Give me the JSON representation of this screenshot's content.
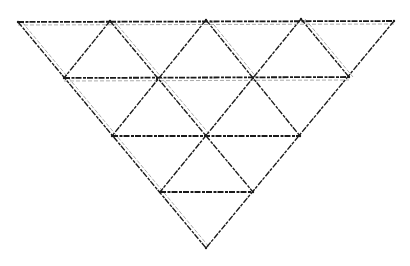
{
  "diagram": {
    "title": "",
    "colors": {
      "background": "#ffffff",
      "stroke": "#1a1a1a",
      "shadow": "#555555"
    },
    "stroke_width": 1.4,
    "dash": "6 1.5 3 1",
    "vertices": {
      "A0": [
        18,
        22
      ],
      "A1": [
        110,
        21
      ],
      "A2": [
        206,
        20
      ],
      "A3": [
        301,
        19
      ],
      "A4": [
        394,
        21
      ],
      "B0": [
        64,
        78
      ],
      "B1": [
        157,
        79
      ],
      "B2": [
        253,
        78
      ],
      "B3": [
        349,
        77
      ],
      "C0": [
        112,
        136
      ],
      "C1": [
        206,
        135
      ],
      "C2": [
        300,
        136
      ],
      "D0": [
        160,
        192
      ],
      "D1": [
        253,
        192
      ],
      "E0": [
        206,
        248
      ]
    },
    "horizontal_edges": [
      [
        "A0",
        "A4"
      ],
      [
        "B0",
        "B3"
      ],
      [
        "C0",
        "C2"
      ],
      [
        "D0",
        "D1"
      ]
    ],
    "descending_edges": [
      [
        "A0",
        "E0"
      ],
      [
        "A1",
        "D1"
      ],
      [
        "A2",
        "C2"
      ],
      [
        "A3",
        "B3"
      ]
    ],
    "ascending_edges": [
      [
        "A4",
        "E0"
      ],
      [
        "A3",
        "D0"
      ],
      [
        "A2",
        "C0"
      ],
      [
        "A1",
        "B0"
      ]
    ],
    "doubled_edges": [
      [
        "A0",
        "E0"
      ],
      [
        "A1",
        "C1"
      ],
      [
        "A2",
        "B2"
      ],
      [
        "A3",
        "B3"
      ],
      [
        "A0",
        "A4"
      ],
      [
        "B0",
        "B3"
      ]
    ]
  }
}
